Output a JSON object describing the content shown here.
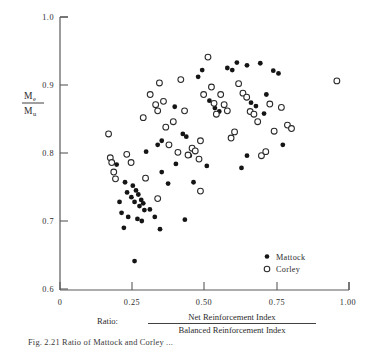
{
  "chart_data": {
    "type": "scatter",
    "title": "",
    "xlabel": "Ratio:  Net Reinforcement Index / Balanced Reinforcement Index",
    "ylabel": "Me/Mu",
    "xlim": [
      0,
      1.0
    ],
    "ylim": [
      0.6,
      1.0
    ],
    "xticks": [
      0,
      0.25,
      0.5,
      0.75,
      1.0
    ],
    "xtick_labels": [
      "0",
      "0.25",
      "0.50",
      "0.75",
      "1.00"
    ],
    "yticks": [
      0.6,
      0.7,
      0.8,
      0.9,
      1.0
    ],
    "ytick_labels": [
      "0.6",
      "0.7",
      "0.8",
      "0.9",
      "1.0"
    ],
    "grid": false,
    "legend_position": "bottom-right",
    "series": [
      {
        "name": "Mattock",
        "marker": "filled-circle",
        "color": "#151515",
        "points": [
          [
            0.225,
            0.757
          ],
          [
            0.232,
            0.742
          ],
          [
            0.247,
            0.735
          ],
          [
            0.252,
            0.752
          ],
          [
            0.258,
            0.728
          ],
          [
            0.263,
            0.745
          ],
          [
            0.271,
            0.739
          ],
          [
            0.275,
            0.722
          ],
          [
            0.281,
            0.731
          ],
          [
            0.288,
            0.726
          ],
          [
            0.292,
            0.716
          ],
          [
            0.206,
            0.728
          ],
          [
            0.213,
            0.712
          ],
          [
            0.236,
            0.706
          ],
          [
            0.268,
            0.703
          ],
          [
            0.283,
            0.7
          ],
          [
            0.221,
            0.69
          ],
          [
            0.258,
            0.641
          ],
          [
            0.196,
            0.783
          ],
          [
            0.311,
            0.717
          ],
          [
            0.328,
            0.706
          ],
          [
            0.346,
            0.688
          ],
          [
            0.352,
            0.772
          ],
          [
            0.374,
            0.755
          ],
          [
            0.298,
            0.802
          ],
          [
            0.338,
            0.812
          ],
          [
            0.352,
            0.818
          ],
          [
            0.401,
            0.784
          ],
          [
            0.397,
            0.868
          ],
          [
            0.425,
            0.828
          ],
          [
            0.437,
            0.824
          ],
          [
            0.449,
            0.796
          ],
          [
            0.462,
            0.757
          ],
          [
            0.478,
            0.912
          ],
          [
            0.492,
            0.922
          ],
          [
            0.508,
            0.781
          ],
          [
            0.517,
            0.877
          ],
          [
            0.536,
            0.866
          ],
          [
            0.551,
            0.861
          ],
          [
            0.579,
            0.925
          ],
          [
            0.596,
            0.922
          ],
          [
            0.612,
            0.933
          ],
          [
            0.628,
            0.778
          ],
          [
            0.647,
            0.929
          ],
          [
            0.661,
            0.874
          ],
          [
            0.678,
            0.869
          ],
          [
            0.693,
            0.932
          ],
          [
            0.706,
            0.858
          ],
          [
            0.714,
            0.886
          ],
          [
            0.738,
            0.921
          ],
          [
            0.756,
            0.917
          ],
          [
            0.771,
            0.812
          ],
          [
            0.647,
            0.796
          ],
          [
            0.432,
            0.702
          ]
        ]
      },
      {
        "name": "Corley",
        "marker": "open-circle",
        "color": "#ffffff",
        "points": [
          [
            0.168,
            0.828
          ],
          [
            0.174,
            0.793
          ],
          [
            0.179,
            0.786
          ],
          [
            0.186,
            0.772
          ],
          [
            0.192,
            0.762
          ],
          [
            0.231,
            0.798
          ],
          [
            0.246,
            0.786
          ],
          [
            0.288,
            0.852
          ],
          [
            0.312,
            0.886
          ],
          [
            0.331,
            0.871
          ],
          [
            0.338,
            0.862
          ],
          [
            0.344,
            0.903
          ],
          [
            0.358,
            0.876
          ],
          [
            0.366,
            0.838
          ],
          [
            0.377,
            0.812
          ],
          [
            0.392,
            0.846
          ],
          [
            0.408,
            0.801
          ],
          [
            0.418,
            0.908
          ],
          [
            0.431,
            0.862
          ],
          [
            0.443,
            0.797
          ],
          [
            0.457,
            0.807
          ],
          [
            0.468,
            0.803
          ],
          [
            0.481,
            0.791
          ],
          [
            0.486,
            0.818
          ],
          [
            0.497,
            0.886
          ],
          [
            0.512,
            0.941
          ],
          [
            0.524,
            0.897
          ],
          [
            0.533,
            0.873
          ],
          [
            0.541,
            0.857
          ],
          [
            0.556,
            0.886
          ],
          [
            0.568,
            0.871
          ],
          [
            0.579,
            0.862
          ],
          [
            0.592,
            0.822
          ],
          [
            0.604,
            0.831
          ],
          [
            0.618,
            0.902
          ],
          [
            0.633,
            0.888
          ],
          [
            0.646,
            0.882
          ],
          [
            0.658,
            0.861
          ],
          [
            0.671,
            0.857
          ],
          [
            0.684,
            0.846
          ],
          [
            0.697,
            0.796
          ],
          [
            0.712,
            0.802
          ],
          [
            0.726,
            0.872
          ],
          [
            0.741,
            0.832
          ],
          [
            0.766,
            0.867
          ],
          [
            0.787,
            0.841
          ],
          [
            0.801,
            0.836
          ],
          [
            0.958,
            0.906
          ],
          [
            0.338,
            0.733
          ],
          [
            0.486,
            0.744
          ],
          [
            0.296,
            0.763
          ]
        ]
      }
    ]
  },
  "axis": {
    "y_label_numerator": "M",
    "y_label_numerator_sub": "e",
    "y_label_denominator": "M",
    "y_label_denominator_sub": "u",
    "x_label_prefix": "Ratio:",
    "x_label_numerator": "Net Reinforcement Index",
    "x_label_denominator": "Balanced Reinforcement Index"
  },
  "legend": {
    "items": [
      {
        "label": "Mattock",
        "marker": "filled-circle"
      },
      {
        "label": "Corley",
        "marker": "open-circle"
      }
    ]
  },
  "caption": {
    "text": "Fig. 2.21 Ratio of Mattock and Corley ..."
  }
}
